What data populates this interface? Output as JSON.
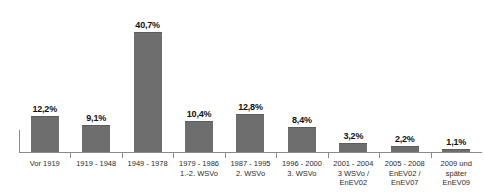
{
  "chart_data": {
    "type": "bar",
    "title": "",
    "subtitle": "",
    "xlabel": "",
    "ylabel": "",
    "ylim": [
      0,
      45
    ],
    "grid": false,
    "legend": "none",
    "bar_color": "#6e6e6e",
    "axis_color": "#8a8a8a",
    "value_suffix": "%",
    "decimal_separator": ",",
    "categories": [
      "Vor 1919",
      "1919 - 1948",
      "1949 - 1978",
      "1979 - 1986 1.-2. WSVo",
      "1987 - 1995 2. WSVo",
      "1996 - 2000 3. WSVo",
      "2001 - 2004 3 WSVo / EnEV02",
      "2005 - 2008 EnEV02 / EnEV07",
      "2009 und später EnEV09"
    ],
    "values": [
      12.2,
      9.1,
      40.7,
      10.4,
      12.8,
      8.4,
      3.2,
      2.2,
      1.1
    ],
    "bars": [
      {
        "value": 12.2,
        "value_label": "12,2%",
        "label_lines": [
          "Vor 1919"
        ]
      },
      {
        "value": 9.1,
        "value_label": "9,1%",
        "label_lines": [
          "1919 - 1948"
        ]
      },
      {
        "value": 40.7,
        "value_label": "40,7%",
        "label_lines": [
          "1949 - 1978"
        ]
      },
      {
        "value": 10.4,
        "value_label": "10,4%",
        "label_lines": [
          "1979 - 1986",
          "1.-2. WSVo"
        ]
      },
      {
        "value": 12.8,
        "value_label": "12,8%",
        "label_lines": [
          "1987 - 1995",
          "2. WSVo"
        ]
      },
      {
        "value": 8.4,
        "value_label": "8,4%",
        "label_lines": [
          "1996 - 2000",
          "3. WSVo"
        ]
      },
      {
        "value": 3.2,
        "value_label": "3,2%",
        "label_lines": [
          "2001 - 2004",
          "3 WSVo /",
          "EnEV02"
        ]
      },
      {
        "value": 2.2,
        "value_label": "2,2%",
        "label_lines": [
          "2005 - 2008",
          "EnEV02 /",
          "EnEV07"
        ]
      },
      {
        "value": 1.1,
        "value_label": "1,1%",
        "label_lines": [
          "2009 und",
          "später",
          "EnEV09"
        ]
      }
    ]
  }
}
